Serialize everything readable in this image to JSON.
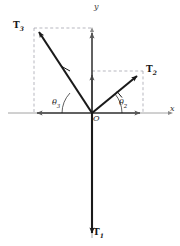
{
  "figure": {
    "background": "#ffffff",
    "axis_color": "#7a7a7a",
    "vector_color": "#1a1a1a",
    "dashed_color": "#9a9aa5",
    "origin": {
      "label": "O",
      "x": 92,
      "y": 113
    },
    "axes": {
      "x_label": "x",
      "y_label": "y",
      "x_min": 8,
      "x_max": 172,
      "y_min": 30,
      "y_max": 238
    },
    "vectors": [
      {
        "name": "T1",
        "label": "T",
        "subscript": "1",
        "tip_x": 92,
        "tip_y": 238,
        "direction_deg": 270
      },
      {
        "name": "T2",
        "label": "T",
        "subscript": "2",
        "tip_x": 141,
        "tip_y": 72,
        "direction_deg": 40
      },
      {
        "name": "T3",
        "label": "T",
        "subscript": "3",
        "tip_x": 35,
        "tip_y": 28,
        "direction_deg": 124
      }
    ],
    "angles": [
      {
        "name": "theta2",
        "label": "θ",
        "subscript": "2",
        "between": "x-axis and T2"
      },
      {
        "name": "theta3",
        "label": "θ",
        "subscript": "3",
        "between": "negative-x-axis and T3"
      }
    ],
    "components": [
      {
        "name": "T2x",
        "from_x": 92,
        "from_y": 113,
        "to_x": 143,
        "to_y": 113
      },
      {
        "name": "T2y",
        "from_x": 92,
        "from_y": 113,
        "to_x": 92,
        "to_y": 71
      },
      {
        "name": "T3x",
        "from_x": 92,
        "from_y": 113,
        "to_x": 34,
        "to_y": 113
      },
      {
        "name": "T3y",
        "from_x": 92,
        "from_y": 113,
        "to_x": 92,
        "to_y": 28
      }
    ],
    "dashed_boxes": [
      {
        "name": "T2-box",
        "x": 92,
        "y": 71,
        "w": 51,
        "h": 42
      },
      {
        "name": "T3-box",
        "x": 34,
        "y": 28,
        "w": 58,
        "h": 85
      }
    ]
  }
}
